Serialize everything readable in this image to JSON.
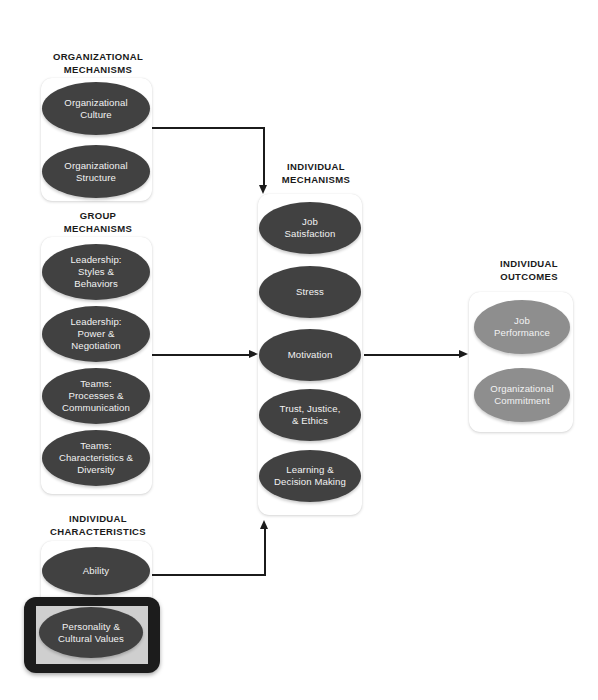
{
  "diagram": {
    "colors": {
      "node_dark": "#414141",
      "node_light": "#8e8e8e",
      "card_background": "#ffffff",
      "connector": "#1b1b1b",
      "highlight_frame": "#1c1c1c",
      "highlight_inner": "#cfcfcf",
      "node_text": "#f2f2f2",
      "label_text": "#1a1a1a",
      "page_background": "#ffffff"
    },
    "sections": [
      {
        "id": "organizational-mechanisms",
        "label": "ORGANIZATIONAL\nMECHANISMS",
        "node_style": "dark",
        "nodes": [
          {
            "id": "organizational-culture",
            "label": "Organizational\nCulture"
          },
          {
            "id": "organizational-structure",
            "label": "Organizational\nStructure"
          }
        ]
      },
      {
        "id": "group-mechanisms",
        "label": "GROUP\nMECHANISMS",
        "node_style": "dark",
        "nodes": [
          {
            "id": "leadership-styles-behaviors",
            "label": "Leadership:\nStyles &\nBehaviors"
          },
          {
            "id": "leadership-power-negotiation",
            "label": "Leadership:\nPower &\nNegotiation"
          },
          {
            "id": "teams-processes-communication",
            "label": "Teams:\nProcesses &\nCommunication"
          },
          {
            "id": "teams-characteristics-diversity",
            "label": "Teams:\nCharacteristics &\nDiversity"
          }
        ]
      },
      {
        "id": "individual-characteristics",
        "label": "INDIVIDUAL\nCHARACTERISTICS",
        "node_style": "dark",
        "nodes": [
          {
            "id": "ability",
            "label": "Ability"
          },
          {
            "id": "personality-cultural-values",
            "label": "Personality  &\nCultural Values",
            "highlighted": true
          }
        ]
      },
      {
        "id": "individual-mechanisms",
        "label": "INDIVIDUAL\nMECHANISMS",
        "node_style": "dark",
        "nodes": [
          {
            "id": "job-satisfaction",
            "label": "Job\nSatisfaction"
          },
          {
            "id": "stress",
            "label": "Stress"
          },
          {
            "id": "motivation",
            "label": "Motivation"
          },
          {
            "id": "trust-justice-ethics",
            "label": "Trust, Justice,\n& Ethics"
          },
          {
            "id": "learning-decision-making",
            "label": "Learning &\nDecision Making"
          }
        ]
      },
      {
        "id": "individual-outcomes",
        "label": "INDIVIDUAL\nOUTCOMES",
        "node_style": "light",
        "nodes": [
          {
            "id": "job-performance",
            "label": "Job\nPerformance"
          },
          {
            "id": "organizational-commitment",
            "label": "Organizational\nCommitment"
          }
        ]
      }
    ],
    "connectors": [
      {
        "id": "org-to-individual-mechanisms",
        "from": "organizational-mechanisms",
        "to": "individual-mechanisms",
        "shape": "elbow-right-down",
        "arrowhead": "down"
      },
      {
        "id": "group-to-individual-mechanisms",
        "from": "group-mechanisms",
        "to": "individual-mechanisms",
        "shape": "straight-right",
        "arrowhead": "right"
      },
      {
        "id": "characteristics-to-individual-mechanisms",
        "from": "individual-characteristics",
        "to": "individual-mechanisms",
        "shape": "elbow-right-up",
        "arrowhead": "up"
      },
      {
        "id": "mechanisms-to-outcomes",
        "from": "individual-mechanisms",
        "to": "individual-outcomes",
        "shape": "straight-right",
        "arrowhead": "right"
      }
    ]
  }
}
